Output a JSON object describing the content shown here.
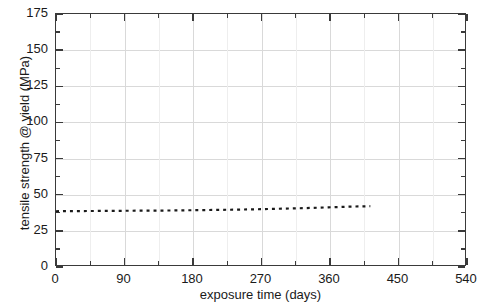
{
  "chart_data": {
    "type": "line",
    "title": "",
    "xlabel": "exposure time (days)",
    "ylabel": "tensile strength @ yield (MPa)",
    "xlim": [
      0,
      540
    ],
    "ylim": [
      0,
      175
    ],
    "xticks": [
      0,
      90,
      180,
      270,
      360,
      450,
      540
    ],
    "xtick_labels": [
      "0",
      "90",
      "180",
      "270",
      "360",
      "450",
      "540"
    ],
    "xticks_minor": [
      45,
      135,
      225,
      315,
      405,
      495
    ],
    "yticks": [
      0,
      25,
      50,
      75,
      100,
      125,
      150,
      175
    ],
    "ytick_labels": [
      "0",
      "25",
      "50",
      "75",
      "100",
      "125",
      "150",
      "175"
    ],
    "yticks_minor": [
      12.5,
      37.5,
      62.5,
      87.5,
      112.5,
      137.5,
      162.5
    ],
    "grid": true,
    "grid_color": "#d9d9d9",
    "legend": null,
    "legend_position": "none",
    "axis_color": "#3a3a3a",
    "series": [
      {
        "name": "tensile strength @ yield",
        "style": "dotted",
        "color": "#1a1a1a",
        "x": [
          0,
          30,
          60,
          90,
          120,
          150,
          180,
          210,
          240,
          270,
          300,
          330,
          360,
          390,
          415
        ],
        "values": [
          37.5,
          37.6,
          37.7,
          37.8,
          37.9,
          38.0,
          38.2,
          38.4,
          38.6,
          38.9,
          39.3,
          39.7,
          40.2,
          40.7,
          41.0
        ]
      }
    ]
  },
  "axis": {
    "ylabel_text": "tensile strength @ yield (MPa)",
    "xlabel_text": "exposure time (days)"
  }
}
